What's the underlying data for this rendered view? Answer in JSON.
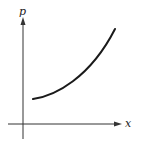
{
  "diagram": {
    "type": "function-graph",
    "axes": {
      "x_label": "x",
      "y_label": "p"
    },
    "curve": {
      "description": "increasing convex curve",
      "path": "M 33 99 C 55 96, 90 78, 115 29"
    },
    "colors": {
      "axis": "#333333",
      "curve": "#1a1a1a",
      "background": "#ffffff"
    }
  }
}
